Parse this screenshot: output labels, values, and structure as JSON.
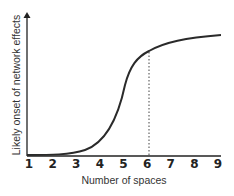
{
  "chart_data": {
    "type": "line",
    "title": "",
    "xlabel": "Number of spaces",
    "ylabel": "Likely onset of network effects",
    "x": [
      1,
      2,
      3,
      4,
      5,
      6,
      7,
      8,
      9
    ],
    "categories": [
      "1",
      "2",
      "3",
      "4",
      "5",
      "6",
      "7",
      "8",
      "9"
    ],
    "series": [
      {
        "name": "Likely onset of network effects",
        "values": [
          0.0,
          0.01,
          0.05,
          0.2,
          0.55,
          0.85,
          0.93,
          0.96,
          0.98
        ]
      }
    ],
    "annotations": [
      {
        "type": "vertical-dotted-line",
        "x": 6
      }
    ],
    "xlim": [
      1,
      9
    ],
    "ylim": [
      0,
      1
    ],
    "y_ticks_shown": false,
    "grid": false,
    "legend": "none"
  },
  "colors": {
    "line": "#2a2a2a",
    "axis": "#222222",
    "text": "#333333"
  }
}
